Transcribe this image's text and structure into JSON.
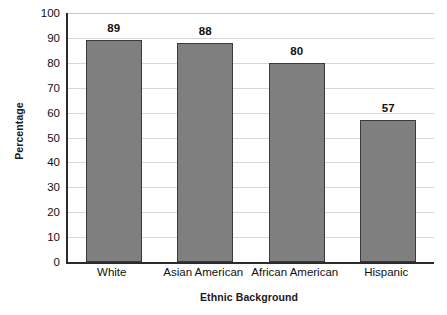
{
  "chart_data": {
    "type": "bar",
    "title": "",
    "xlabel": "Ethnic Background",
    "ylabel": "Percentage",
    "categories": [
      "White",
      "Asian American",
      "African American",
      "Hispanic"
    ],
    "values": [
      89,
      88,
      80,
      57
    ],
    "value_labels": [
      "89",
      "88",
      "80",
      "57"
    ],
    "ylim": [
      0,
      100
    ],
    "ytick_labels": [
      "100",
      "90",
      "80",
      "70",
      "60",
      "50",
      "40",
      "30",
      "20",
      "10",
      "0"
    ],
    "ytick_values": [
      100,
      90,
      80,
      70,
      60,
      50,
      40,
      30,
      20,
      10,
      0
    ],
    "ytick_step": 10,
    "grid": true,
    "grid_orientation": "horizontal",
    "legend": false,
    "legend_position": "none",
    "bar_color": "#7f7f7f",
    "bar_border_color": "#3a3a3a",
    "axis_color": "#2b2b2b",
    "grid_color": "#d7d7d7",
    "background_color": "#ffffff",
    "text_color": "#111111"
  }
}
